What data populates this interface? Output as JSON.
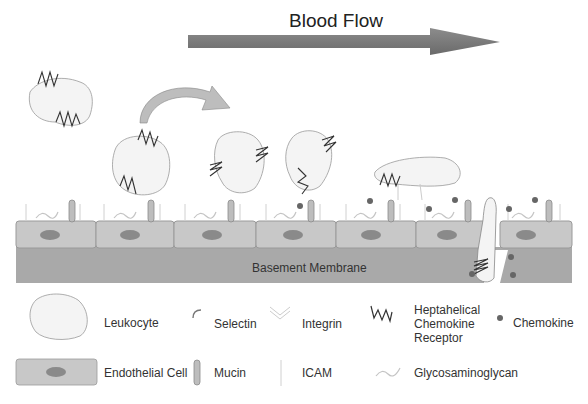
{
  "title": "Blood Flow",
  "basement_membrane_label": "Basement Membrane",
  "legend": {
    "items": [
      {
        "id": "leukocyte",
        "label": "Leukocyte"
      },
      {
        "id": "selectin",
        "label": "Selectin"
      },
      {
        "id": "integrin",
        "label": "Integrin"
      },
      {
        "id": "receptor",
        "label_lines": [
          "Heptahelical",
          "Chemokine",
          "Receptor"
        ]
      },
      {
        "id": "chemokine",
        "label": "Chemokine"
      },
      {
        "id": "endothelial",
        "label": "Endothelial Cell"
      },
      {
        "id": "mucin",
        "label": "Mucin"
      },
      {
        "id": "icam",
        "label": "ICAM"
      },
      {
        "id": "gag",
        "label": "Glycosaminoglycan"
      }
    ]
  },
  "colors": {
    "arrow": "#7a7a7a",
    "cell_fill": "#c8c8c8",
    "cell_stroke": "#9a9a9a",
    "nucleus": "#8a8a8a",
    "membrane": "#a9a9a9",
    "leukocyte_fill": "#f4f4f4",
    "receptor": "#333333",
    "chemokine": "#666666"
  }
}
